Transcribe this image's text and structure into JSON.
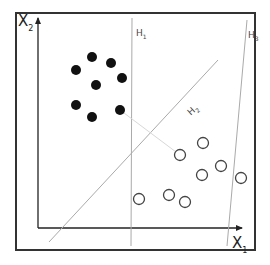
{
  "diagram": {
    "title": "",
    "axes": {
      "x_label": {
        "main": "X",
        "sub": "1"
      },
      "y_label": {
        "main": "X",
        "sub": "2"
      }
    },
    "hyperplanes": [
      {
        "id": "H1",
        "label": {
          "main": "H",
          "sub": "1"
        },
        "x1": 132,
        "y1": 18,
        "x2": 131,
        "y2": 246
      },
      {
        "id": "H2",
        "label": {
          "main": "H",
          "sub": "2"
        },
        "x1": 218,
        "y1": 60,
        "x2": 49,
        "y2": 242
      },
      {
        "id": "H3",
        "label": {
          "main": "H",
          "sub": "3"
        },
        "x1": 247,
        "y1": 20,
        "x2": 227,
        "y2": 246
      }
    ],
    "margin_line": {
      "x1": 120,
      "y1": 110,
      "x2": 180,
      "y2": 155
    },
    "class_filled": [
      {
        "x": 92,
        "y": 57
      },
      {
        "x": 111,
        "y": 63
      },
      {
        "x": 76,
        "y": 70
      },
      {
        "x": 122,
        "y": 78
      },
      {
        "x": 96,
        "y": 85
      },
      {
        "x": 76,
        "y": 105
      },
      {
        "x": 92,
        "y": 117
      },
      {
        "x": 120,
        "y": 110
      }
    ],
    "class_open": [
      {
        "x": 203,
        "y": 143
      },
      {
        "x": 180,
        "y": 155
      },
      {
        "x": 221,
        "y": 166
      },
      {
        "x": 202,
        "y": 175
      },
      {
        "x": 241,
        "y": 178
      },
      {
        "x": 139,
        "y": 199
      },
      {
        "x": 169,
        "y": 195
      },
      {
        "x": 185,
        "y": 202
      }
    ],
    "colors": {
      "frame": "#333333",
      "axis": "#222222",
      "hyperplane": "#aaaaaa",
      "dot": "#111111",
      "open": "#444444"
    }
  }
}
